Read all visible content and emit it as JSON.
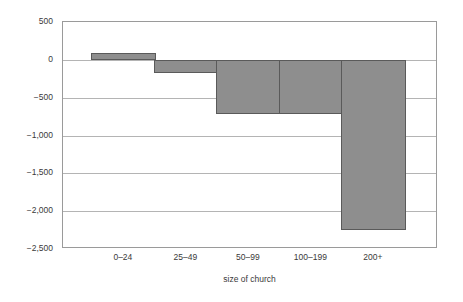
{
  "chart_data": {
    "type": "bar",
    "title": "",
    "subtitle": "",
    "xlabel": "size of church",
    "ylabel": "change in adult USA",
    "categories": [
      "0–24",
      "25–49",
      "50–99",
      "100–199",
      "200+"
    ],
    "values": [
      90,
      -170,
      -715,
      -715,
      -2250
    ],
    "series": [
      {
        "name": "change in adult USA",
        "values": [
          90,
          -170,
          -715,
          -715,
          -2250
        ]
      }
    ],
    "ylim": [
      -2500,
      500
    ],
    "y_ticks": [
      500,
      0,
      -500,
      -1000,
      -1500,
      -2000,
      -2500
    ],
    "y_tick_labels": [
      "500",
      "0",
      "−500",
      "−1,000",
      "−1,500",
      "−2,000",
      "−2,500"
    ],
    "grid": true,
    "grid_axis": "y",
    "legend": false,
    "legend_position": "none",
    "annotations": [],
    "colors": {
      "bar_fill": "#8e8e8e",
      "bar_border": "#5a5a5a",
      "gridline": "#b4b4b4",
      "frame": "#9a9a9a",
      "background": "#ffffff",
      "text": "#3a3a3a"
    }
  }
}
